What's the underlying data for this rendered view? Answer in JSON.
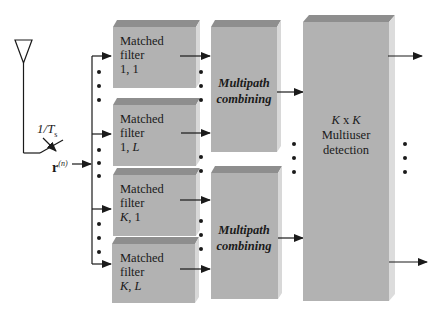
{
  "diagram": {
    "type": "block-diagram",
    "colors": {
      "box_front": "#b2b2b2",
      "box_top": "#8e8e8e",
      "box_side": "#d8d8d8",
      "line": "#1a1a1a"
    },
    "antenna": {
      "sampling_label_prefix": "1/",
      "sampling_label_var": "T",
      "sampling_label_sub": "s"
    },
    "input_signal": {
      "var": "r",
      "superscript": "(n)"
    },
    "matched_filters": [
      {
        "line1": "Matched",
        "line2": "filter",
        "index_a": "1",
        "sep": ", ",
        "index_b": "1"
      },
      {
        "line1": "Matched",
        "line2": "filter",
        "index_a": "1",
        "sep": ", ",
        "index_b": "L"
      },
      {
        "line1": "Matched",
        "line2": "filter",
        "index_a": "K",
        "sep": ", ",
        "index_b": "1"
      },
      {
        "line1": "Matched",
        "line2": "filter",
        "index_a": "K",
        "sep": ", ",
        "index_b": "L"
      }
    ],
    "multipath_blocks": [
      {
        "line1": "Multipath",
        "line2": "combining"
      },
      {
        "line1": "Multipath",
        "line2": "combining"
      }
    ],
    "multiuser_detection": {
      "dim_a": "K",
      "times": " x ",
      "dim_b": "K",
      "line2": "Multiuser",
      "line3": "detection"
    },
    "outputs": 2
  }
}
